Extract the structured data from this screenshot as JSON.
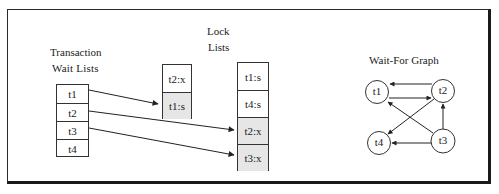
{
  "diagram": {
    "type": "lock-table-and-wait-for-graph",
    "transaction_wait_lists": {
      "title_line1": "Transaction",
      "title_line2": "Wait  Lists",
      "items": [
        "t1",
        "t2",
        "t3",
        "t4"
      ]
    },
    "lock_lists": {
      "title_line1": "Lock",
      "title_line2": "Lists",
      "list_a": [
        {
          "label": "t2:x",
          "shaded": false
        },
        {
          "label": "t1:s",
          "shaded": true
        }
      ],
      "list_b": [
        {
          "label": "t1:s",
          "shaded": false
        },
        {
          "label": "t4:s",
          "shaded": false
        },
        {
          "label": "t2:x",
          "shaded": true
        },
        {
          "label": "t3:x",
          "shaded": true
        }
      ]
    },
    "pointers": [
      {
        "from": "t1",
        "to": "list_a.t1:s"
      },
      {
        "from": "t2",
        "to": "list_b.t2:x"
      },
      {
        "from": "t3",
        "to": "list_b.t3:x"
      }
    ],
    "wait_for_graph": {
      "title": "Wait-For Graph",
      "nodes": [
        "t1",
        "t2",
        "t3",
        "t4"
      ],
      "edges": [
        {
          "from": "t2",
          "to": "t1"
        },
        {
          "from": "t1",
          "to": "t2"
        },
        {
          "from": "t2",
          "to": "t4"
        },
        {
          "from": "t3",
          "to": "t1"
        },
        {
          "from": "t3",
          "to": "t4"
        },
        {
          "from": "t3",
          "to": "t2"
        }
      ]
    },
    "colors": {
      "line": "#222222",
      "shaded_cell": "#e6e6e6",
      "background": "#ffffff"
    }
  }
}
